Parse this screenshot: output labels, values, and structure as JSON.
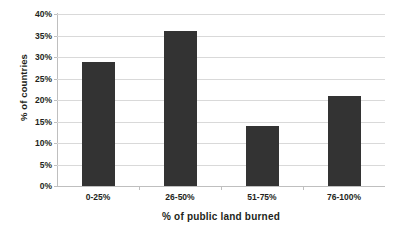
{
  "chart_data": {
    "type": "bar",
    "title": "",
    "subtitle": "",
    "xlabel": "% of public land burned",
    "ylabel": "% of countries",
    "categories": [
      "0-25%",
      "26-50%",
      "51-75%",
      "76-100%"
    ],
    "values": [
      28.8,
      36.0,
      14.0,
      21.0
    ],
    "series": [
      {
        "name": "% of countries",
        "values": [
          28.8,
          36.0,
          14.0,
          21.0
        ]
      }
    ],
    "ylim": [
      0,
      40
    ],
    "ytick_values": [
      0,
      5,
      10,
      15,
      20,
      25,
      30,
      35,
      40
    ],
    "ytick_labels": [
      "0%",
      "5%",
      "10%",
      "15%",
      "20%",
      "25%",
      "30%",
      "35%",
      "40%"
    ],
    "grid": true,
    "grid_axis": "y",
    "legend": false,
    "legend_position": "none",
    "annotations": [],
    "colors": {
      "bar_fill": "#333333",
      "gridline": "#d9d9d9",
      "axis_line": "#bfbfbf",
      "text": "#231f20",
      "background": "#ffffff"
    }
  }
}
